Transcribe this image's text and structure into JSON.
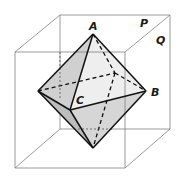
{
  "figure": {
    "labels": {
      "A": "A",
      "B": "B",
      "C": "C",
      "P": "P",
      "Q": "Q"
    },
    "colors": {
      "cube_edge": "#777777",
      "octa_edge": "#111111",
      "face_light": "#f1f1f1",
      "face_mid": "#dcdcdc",
      "face_dark": "#c6c6c6"
    },
    "vertices": {
      "A_top": [
        93,
        34
      ],
      "B_right": [
        146,
        91
      ],
      "C_front": [
        70,
        110
      ],
      "left": [
        38,
        91
      ],
      "back": [
        115,
        73
      ],
      "bottom": [
        93,
        148
      ]
    },
    "cube": {
      "front": [
        [
          15,
          52
        ],
        [
          125,
          52
        ],
        [
          125,
          168
        ],
        [
          15,
          168
        ]
      ],
      "back": [
        [
          60,
          15
        ],
        [
          170,
          15
        ],
        [
          170,
          129
        ],
        [
          60,
          129
        ]
      ]
    }
  }
}
